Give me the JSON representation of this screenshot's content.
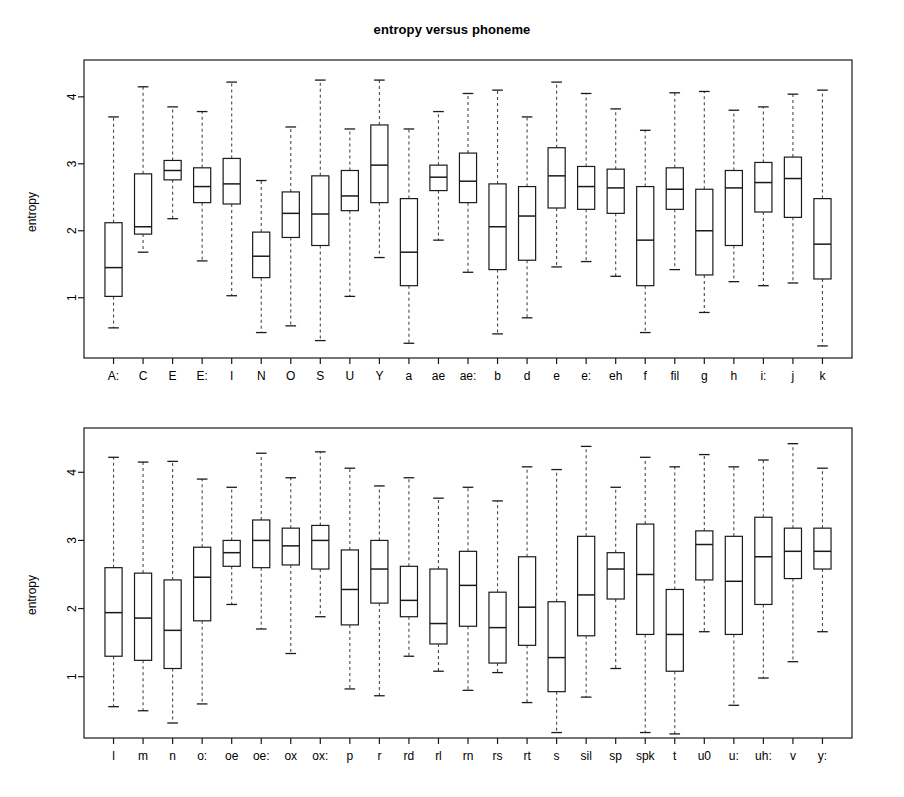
{
  "chart_data": [
    {
      "type": "box",
      "panel": "top",
      "title": "entropy versus phoneme",
      "xlabel": "",
      "ylabel": "entropy",
      "ylim": [
        0.1,
        4.55
      ],
      "yticks": [
        1,
        2,
        3,
        4
      ],
      "grid": false,
      "legend": "none",
      "categories": [
        "A:",
        "C",
        "E",
        "E:",
        "I",
        "N",
        "O",
        "S",
        "U",
        "Y",
        "a",
        "ae",
        "ae:",
        "b",
        "d",
        "e",
        "e:",
        "eh",
        "f",
        "fil",
        "g",
        "h",
        "i:",
        "j",
        "k"
      ],
      "boxes": [
        {
          "label": "A:",
          "whisker_low": 0.55,
          "q1": 1.02,
          "median": 1.45,
          "q3": 2.12,
          "whisker_high": 3.7
        },
        {
          "label": "C",
          "whisker_low": 1.68,
          "q1": 1.95,
          "median": 2.06,
          "q3": 2.85,
          "whisker_high": 4.15
        },
        {
          "label": "E",
          "whisker_low": 2.18,
          "q1": 2.76,
          "median": 2.9,
          "q3": 3.05,
          "whisker_high": 3.85
        },
        {
          "label": "E:",
          "whisker_low": 1.55,
          "q1": 2.42,
          "median": 2.66,
          "q3": 2.94,
          "whisker_high": 3.78
        },
        {
          "label": "I",
          "whisker_low": 1.03,
          "q1": 2.4,
          "median": 2.7,
          "q3": 3.08,
          "whisker_high": 4.22
        },
        {
          "label": "N",
          "whisker_low": 0.48,
          "q1": 1.3,
          "median": 1.62,
          "q3": 1.98,
          "whisker_high": 2.75
        },
        {
          "label": "O",
          "whisker_low": 0.58,
          "q1": 1.9,
          "median": 2.26,
          "q3": 2.58,
          "whisker_high": 3.55
        },
        {
          "label": "S",
          "whisker_low": 0.36,
          "q1": 1.78,
          "median": 2.25,
          "q3": 2.82,
          "whisker_high": 4.25
        },
        {
          "label": "U",
          "whisker_low": 1.02,
          "q1": 2.3,
          "median": 2.52,
          "q3": 2.9,
          "whisker_high": 3.52
        },
        {
          "label": "Y",
          "whisker_low": 1.6,
          "q1": 2.42,
          "median": 2.98,
          "q3": 3.58,
          "whisker_high": 4.25
        },
        {
          "label": "a",
          "whisker_low": 0.32,
          "q1": 1.18,
          "median": 1.68,
          "q3": 2.48,
          "whisker_high": 3.52
        },
        {
          "label": "ae",
          "whisker_low": 1.86,
          "q1": 2.6,
          "median": 2.8,
          "q3": 2.98,
          "whisker_high": 3.78
        },
        {
          "label": "ae:",
          "whisker_low": 1.38,
          "q1": 2.42,
          "median": 2.74,
          "q3": 3.16,
          "whisker_high": 4.05
        },
        {
          "label": "b",
          "whisker_low": 0.46,
          "q1": 1.42,
          "median": 2.06,
          "q3": 2.7,
          "whisker_high": 4.1
        },
        {
          "label": "d",
          "whisker_low": 0.7,
          "q1": 1.56,
          "median": 2.22,
          "q3": 2.66,
          "whisker_high": 3.7
        },
        {
          "label": "e",
          "whisker_low": 1.46,
          "q1": 2.34,
          "median": 2.82,
          "q3": 3.24,
          "whisker_high": 4.22
        },
        {
          "label": "e:",
          "whisker_low": 1.54,
          "q1": 2.32,
          "median": 2.66,
          "q3": 2.96,
          "whisker_high": 4.05
        },
        {
          "label": "eh",
          "whisker_low": 1.32,
          "q1": 2.26,
          "median": 2.64,
          "q3": 2.92,
          "whisker_high": 3.82
        },
        {
          "label": "f",
          "whisker_low": 0.48,
          "q1": 1.18,
          "median": 1.86,
          "q3": 2.66,
          "whisker_high": 3.5
        },
        {
          "label": "fil",
          "whisker_low": 1.42,
          "q1": 2.32,
          "median": 2.62,
          "q3": 2.94,
          "whisker_high": 4.06
        },
        {
          "label": "g",
          "whisker_low": 0.78,
          "q1": 1.34,
          "median": 2.0,
          "q3": 2.62,
          "whisker_high": 4.08
        },
        {
          "label": "h",
          "whisker_low": 1.24,
          "q1": 1.78,
          "median": 2.64,
          "q3": 2.9,
          "whisker_high": 3.8
        },
        {
          "label": "i:",
          "whisker_low": 1.18,
          "q1": 2.28,
          "median": 2.72,
          "q3": 3.02,
          "whisker_high": 3.85
        },
        {
          "label": "j",
          "whisker_low": 1.22,
          "q1": 2.2,
          "median": 2.78,
          "q3": 3.1,
          "whisker_high": 4.04
        },
        {
          "label": "k",
          "whisker_low": 0.28,
          "q1": 1.28,
          "median": 1.8,
          "q3": 2.48,
          "whisker_high": 4.1
        }
      ]
    },
    {
      "type": "box",
      "panel": "bottom",
      "title": "",
      "xlabel": "",
      "ylabel": "entropy",
      "ylim": [
        0.1,
        4.65
      ],
      "yticks": [
        1,
        2,
        3,
        4
      ],
      "grid": false,
      "legend": "none",
      "categories": [
        "l",
        "m",
        "n",
        "o:",
        "oe",
        "oe:",
        "ox",
        "ox:",
        "p",
        "r",
        "rd",
        "rl",
        "rn",
        "rs",
        "rt",
        "s",
        "sil",
        "sp",
        "spk",
        "t",
        "u0",
        "u:",
        "uh:",
        "v",
        "y:"
      ],
      "boxes": [
        {
          "label": "l",
          "whisker_low": 0.56,
          "q1": 1.3,
          "median": 1.94,
          "q3": 2.6,
          "whisker_high": 4.22
        },
        {
          "label": "m",
          "whisker_low": 0.5,
          "q1": 1.24,
          "median": 1.86,
          "q3": 2.52,
          "whisker_high": 4.15
        },
        {
          "label": "n",
          "whisker_low": 0.32,
          "q1": 1.12,
          "median": 1.68,
          "q3": 2.42,
          "whisker_high": 4.16
        },
        {
          "label": "o:",
          "whisker_low": 0.6,
          "q1": 1.82,
          "median": 2.46,
          "q3": 2.9,
          "whisker_high": 3.9
        },
        {
          "label": "oe",
          "whisker_low": 2.06,
          "q1": 2.62,
          "median": 2.82,
          "q3": 3.0,
          "whisker_high": 3.78
        },
        {
          "label": "oe:",
          "whisker_low": 1.7,
          "q1": 2.6,
          "median": 3.0,
          "q3": 3.3,
          "whisker_high": 4.28
        },
        {
          "label": "ox",
          "whisker_low": 1.34,
          "q1": 2.64,
          "median": 2.92,
          "q3": 3.18,
          "whisker_high": 3.92
        },
        {
          "label": "ox:",
          "whisker_low": 1.88,
          "q1": 2.58,
          "median": 3.0,
          "q3": 3.22,
          "whisker_high": 4.3
        },
        {
          "label": "p",
          "whisker_low": 0.82,
          "q1": 1.76,
          "median": 2.28,
          "q3": 2.86,
          "whisker_high": 4.06
        },
        {
          "label": "r",
          "whisker_low": 0.72,
          "q1": 2.08,
          "median": 2.58,
          "q3": 3.0,
          "whisker_high": 3.8
        },
        {
          "label": "rd",
          "whisker_low": 1.3,
          "q1": 1.88,
          "median": 2.12,
          "q3": 2.62,
          "whisker_high": 3.92
        },
        {
          "label": "rl",
          "whisker_low": 1.08,
          "q1": 1.48,
          "median": 1.78,
          "q3": 2.58,
          "whisker_high": 3.62
        },
        {
          "label": "rn",
          "whisker_low": 0.8,
          "q1": 1.74,
          "median": 2.34,
          "q3": 2.84,
          "whisker_high": 3.78
        },
        {
          "label": "rs",
          "whisker_low": 1.06,
          "q1": 1.2,
          "median": 1.72,
          "q3": 2.24,
          "whisker_high": 3.58
        },
        {
          "label": "rt",
          "whisker_low": 0.62,
          "q1": 1.46,
          "median": 2.02,
          "q3": 2.76,
          "whisker_high": 4.08
        },
        {
          "label": "s",
          "whisker_low": 0.18,
          "q1": 0.78,
          "median": 1.28,
          "q3": 2.1,
          "whisker_high": 4.04
        },
        {
          "label": "sil",
          "whisker_low": 0.7,
          "q1": 1.6,
          "median": 2.2,
          "q3": 3.06,
          "whisker_high": 4.38
        },
        {
          "label": "sp",
          "whisker_low": 1.12,
          "q1": 2.14,
          "median": 2.58,
          "q3": 2.82,
          "whisker_high": 3.78
        },
        {
          "label": "spk",
          "whisker_low": 0.18,
          "q1": 1.62,
          "median": 2.5,
          "q3": 3.24,
          "whisker_high": 4.22
        },
        {
          "label": "t",
          "whisker_low": 0.16,
          "q1": 1.08,
          "median": 1.62,
          "q3": 2.28,
          "whisker_high": 4.08
        },
        {
          "label": "u0",
          "whisker_low": 1.66,
          "q1": 2.42,
          "median": 2.94,
          "q3": 3.14,
          "whisker_high": 4.26
        },
        {
          "label": "u:",
          "whisker_low": 0.58,
          "q1": 1.62,
          "median": 2.4,
          "q3": 3.06,
          "whisker_high": 4.08
        },
        {
          "label": "uh:",
          "whisker_low": 0.98,
          "q1": 2.06,
          "median": 2.76,
          "q3": 3.34,
          "whisker_high": 4.18
        },
        {
          "label": "v",
          "whisker_low": 1.22,
          "q1": 2.44,
          "median": 2.84,
          "q3": 3.18,
          "whisker_high": 4.42
        },
        {
          "label": "y:",
          "whisker_low": 1.66,
          "q1": 2.58,
          "median": 2.84,
          "q3": 3.18,
          "whisker_high": 4.06
        }
      ]
    }
  ],
  "figure": {
    "title": "entropy versus phoneme",
    "panels": [
      {
        "id": "top",
        "ylabel": "entropy"
      },
      {
        "id": "bottom",
        "ylabel": "entropy"
      }
    ]
  },
  "colors": {
    "ink": "#1a1a1a",
    "background": "#ffffff",
    "box_stroke": "#1a1a1a",
    "whisker_stroke": "#4a4a4a"
  }
}
